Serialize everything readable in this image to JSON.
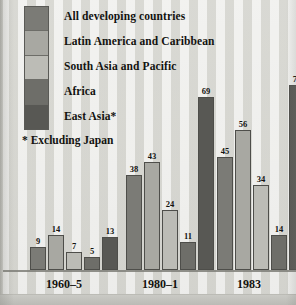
{
  "chart_data": {
    "type": "bar",
    "title": "",
    "subtitle": "",
    "xlabel": "",
    "ylabel": "",
    "ylim": [
      0,
      80
    ],
    "grid": false,
    "legend_position": "top-left",
    "categories": [
      "1960–5",
      "1980–1",
      "1983"
    ],
    "series": [
      {
        "name": "All developing countries",
        "color": "#7b7b76",
        "values": [
          9,
          38,
          45
        ]
      },
      {
        "name": "Latin America and Caribbean",
        "color": "#a8a8a2",
        "values": [
          14,
          43,
          56
        ]
      },
      {
        "name": "South Asia and Pacific",
        "color": "#bcbcb6",
        "values": [
          7,
          24,
          34
        ]
      },
      {
        "name": "Africa",
        "color": "#6e6e69",
        "values": [
          5,
          11,
          14
        ]
      },
      {
        "name": "East Asia*",
        "color": "#585854",
        "values": [
          13,
          69,
          74
        ]
      }
    ],
    "annotations": [
      "* Excluding Japan"
    ]
  },
  "legend": {
    "items": [
      {
        "label": "All developing countries"
      },
      {
        "label": "Latin America and Caribbean"
      },
      {
        "label": "South Asia and Pacific"
      },
      {
        "label": "Africa"
      },
      {
        "label": "East Asia*"
      }
    ]
  },
  "footnote": {
    "text": "* Excluding Japan"
  },
  "axis": {
    "group_labels": [
      "1960–5",
      "1980–1",
      "1983"
    ]
  },
  "values": {
    "g0": [
      "9",
      "14",
      "7",
      "5",
      "13"
    ],
    "g1": [
      "38",
      "43",
      "24",
      "11",
      "69"
    ],
    "g2": [
      "45",
      "56",
      "34",
      "14",
      "74"
    ]
  },
  "colors": {
    "paper": "#dcdcd7",
    "ink": "#131310",
    "axis": "#7e7e78",
    "s0": "#7b7b76",
    "s1": "#a8a8a2",
    "s2": "#bcbcb6",
    "s3": "#6e6e69",
    "s4": "#585854"
  }
}
